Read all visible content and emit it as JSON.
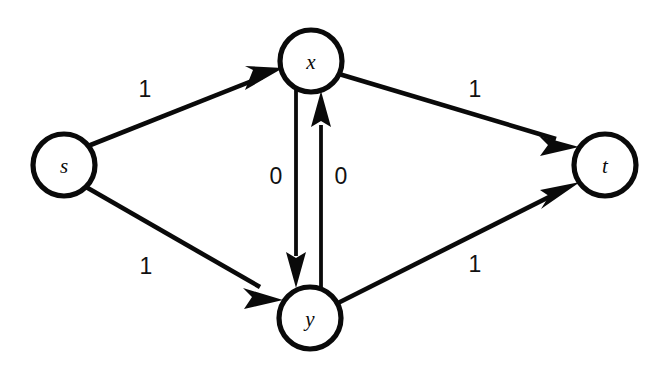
{
  "diagram": {
    "type": "directed-graph",
    "canvas": {
      "width": 664,
      "height": 365,
      "background": "#ffffff"
    },
    "style": {
      "node_stroke": "#0a0a0a",
      "node_fill": "#ffffff",
      "edge_color": "#0a0a0a"
    },
    "nodes": [
      {
        "id": "s",
        "label": "s",
        "cx": 64,
        "cy": 165,
        "r": 31
      },
      {
        "id": "x",
        "label": "x",
        "cx": 311,
        "cy": 61,
        "r": 31
      },
      {
        "id": "y",
        "label": "y",
        "cx": 310,
        "cy": 318,
        "r": 31
      },
      {
        "id": "t",
        "label": "t",
        "cx": 605,
        "cy": 165,
        "r": 31
      }
    ],
    "edges": [
      {
        "id": "s-x",
        "from": "s",
        "to": "x",
        "label": "1",
        "label_x": 145,
        "label_y": 89
      },
      {
        "id": "s-y",
        "from": "s",
        "to": "y",
        "label": "1",
        "label_x": 146,
        "label_y": 266
      },
      {
        "id": "x-t",
        "from": "x",
        "to": "t",
        "label": "1",
        "label_x": 475,
        "label_y": 89
      },
      {
        "id": "y-t",
        "from": "y",
        "to": "t",
        "label": "1",
        "label_x": 475,
        "label_y": 264
      },
      {
        "id": "x-y",
        "from": "x",
        "to": "y",
        "label": "0",
        "label_x": 276,
        "label_y": 176
      },
      {
        "id": "y-x",
        "from": "y",
        "to": "x",
        "label": "0",
        "label_x": 341,
        "label_y": 176
      }
    ]
  }
}
